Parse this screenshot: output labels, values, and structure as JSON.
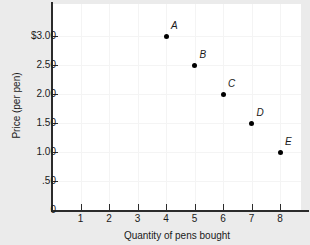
{
  "chart_data": {
    "type": "scatter",
    "title": "",
    "xlabel": "Quantity of pens bought",
    "ylabel": "Price (per pen)",
    "xlim": [
      0,
      8.7
    ],
    "ylim": [
      0,
      3.25
    ],
    "grid": true,
    "legend": "none",
    "x_ticks": [
      {
        "value": 1,
        "label": "1"
      },
      {
        "value": 2,
        "label": "2"
      },
      {
        "value": 3,
        "label": "3"
      },
      {
        "value": 4,
        "label": "4"
      },
      {
        "value": 5,
        "label": "5"
      },
      {
        "value": 6,
        "label": "6"
      },
      {
        "value": 7,
        "label": "7"
      },
      {
        "value": 8,
        "label": "8"
      }
    ],
    "y_ticks": [
      {
        "value": 0,
        "label": "0"
      },
      {
        "value": 0.5,
        "label": ".50"
      },
      {
        "value": 1.0,
        "label": "1.00"
      },
      {
        "value": 1.5,
        "label": "1.50"
      },
      {
        "value": 2.0,
        "label": "2.00"
      },
      {
        "value": 2.5,
        "label": "2.50"
      },
      {
        "value": 3.0,
        "label": "$3.00"
      }
    ],
    "points": [
      {
        "label": "A",
        "x": 4,
        "y": 3.0
      },
      {
        "label": "B",
        "x": 5,
        "y": 2.5
      },
      {
        "label": "C",
        "x": 6,
        "y": 2.0
      },
      {
        "label": "D",
        "x": 7,
        "y": 1.5
      },
      {
        "label": "E",
        "x": 8,
        "y": 1.0
      }
    ],
    "colors": {
      "background": "#ebebeb",
      "plot_background": "#ffffff",
      "axis": "#2b2b2b",
      "grid": "#f4f4f4",
      "marker": "#000000",
      "text": "#1a1a1a"
    }
  }
}
